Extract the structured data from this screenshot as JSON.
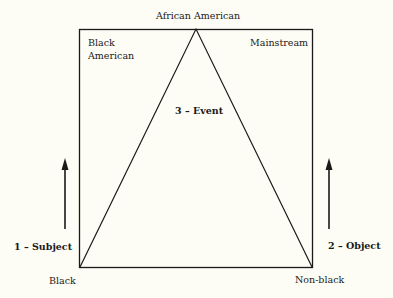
{
  "diagram": {
    "apex_label": "African American",
    "box_top_left_label": "Black American",
    "box_top_left_label_lines": [
      "Black",
      "American"
    ],
    "box_top_right_label": "Mainstream",
    "center_label": "3 – Event",
    "left_axis_label": "1 – Subject",
    "right_axis_label": "2 – Object",
    "bottom_left_label": "Black",
    "bottom_right_label": "Non-black",
    "line_color": "#1a1a1a",
    "background_color": "#fdfdf5"
  }
}
